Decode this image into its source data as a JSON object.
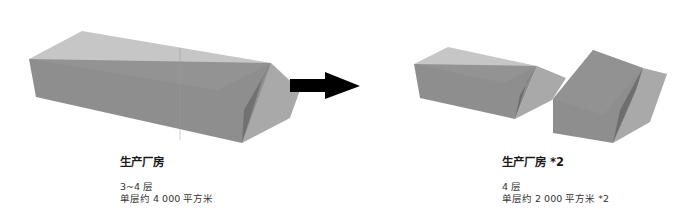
{
  "left": {
    "title": "生产厂房",
    "floors": "3~4 层",
    "area": "单层约 4 000 平方米"
  },
  "right": {
    "title": "生产厂房 *2",
    "floors": "4 层",
    "area": "单层约 2 000 平方米 *2"
  },
  "colors": {
    "box_face": "#8c8c8c",
    "box_top": "#9a9a9a",
    "box_side": "#6a6a6a",
    "shadow": "#a8a8a8",
    "arrow": "#000000"
  }
}
